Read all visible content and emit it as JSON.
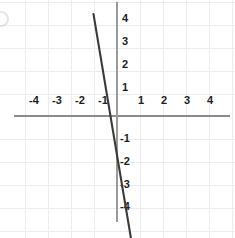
{
  "figure": {
    "background_color": "#ffffff",
    "axis_color": "#8c8c8c",
    "grid_color": "#ececf0",
    "line_color": "#3a3a3a"
  },
  "chart_data": {
    "type": "line",
    "title": "",
    "subtitle": "",
    "xlabel": "",
    "ylabel": "",
    "xlim": [
      -4.9,
      5.1
    ],
    "ylim": [
      -5.2,
      5.1
    ],
    "grid": true,
    "grid_step": 1,
    "legend": "none",
    "x_ticks": [
      -4,
      -3,
      -2,
      -1,
      1,
      2,
      3,
      4
    ],
    "x_tick_labels": [
      "-4",
      "-3",
      "-2",
      "-1",
      "1",
      "2",
      "3",
      "4"
    ],
    "y_ticks": [
      4,
      3,
      2,
      1,
      -1,
      -2,
      -3,
      -4
    ],
    "y_tick_labels": [
      "4",
      "3",
      "2",
      "1",
      "-1",
      "-2",
      "-3",
      "-4"
    ],
    "series": [
      {
        "name": "line",
        "equation": "y = -6x - 1.7",
        "slope": -6,
        "intercept": -1.7,
        "points": [
          {
            "x": -1.02,
            "y": 4.43
          },
          {
            "x": 0.0,
            "y": -1.7
          },
          {
            "x": 0.62,
            "y": -5.4
          }
        ]
      }
    ]
  }
}
